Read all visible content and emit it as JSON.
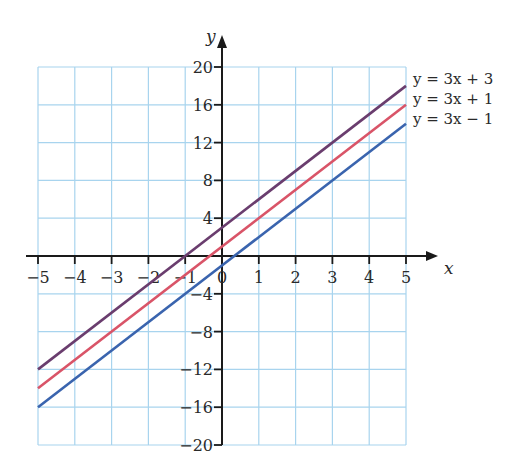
{
  "chart_data": {
    "type": "line",
    "title": "",
    "xlabel": "x",
    "ylabel": "y",
    "xlim": [
      -5,
      5
    ],
    "ylim": [
      -20,
      20
    ],
    "grid": true,
    "x_ticks": [
      -5,
      -4,
      -3,
      -2,
      -1,
      0,
      1,
      2,
      3,
      4,
      5
    ],
    "x_tick_labels": [
      "−5",
      "−4",
      "−3",
      "−2",
      "−1",
      "0",
      "1",
      "2",
      "3",
      "4",
      "5"
    ],
    "y_ticks": [
      -20,
      -16,
      -12,
      -8,
      -4,
      4,
      8,
      12,
      16,
      20
    ],
    "y_tick_labels": [
      "−20",
      "−16",
      "−12",
      "−8",
      "−4",
      "4",
      "8",
      "12",
      "16",
      "20"
    ],
    "legend_position": "right-end-of-lines",
    "series": [
      {
        "name": "y = 3x + 3",
        "slope": 3,
        "intercept": 3,
        "x": [
          -5,
          5
        ],
        "values": [
          -12,
          18
        ],
        "color": "#6a3d6e"
      },
      {
        "name": "y = 3x + 1",
        "slope": 3,
        "intercept": 1,
        "x": [
          -5,
          5
        ],
        "values": [
          -14,
          16
        ],
        "color": "#d95468"
      },
      {
        "name": "y = 3x − 1",
        "slope": 3,
        "intercept": -1,
        "x": [
          -5,
          5
        ],
        "values": [
          -16,
          14
        ],
        "color": "#3a64ae"
      }
    ]
  },
  "colors": {
    "grid": "#a8d4ee",
    "axis": "#1a1a1a"
  }
}
